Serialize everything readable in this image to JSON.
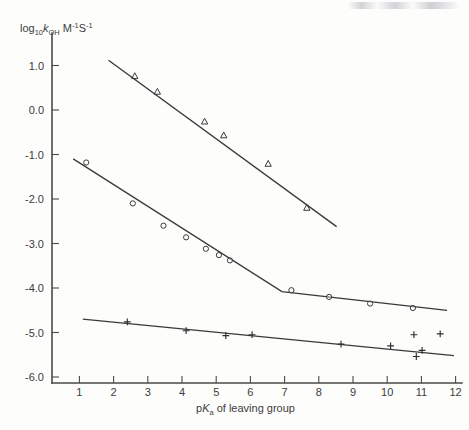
{
  "chart_data": {
    "type": "scatter",
    "title": "",
    "xlabel": "pKa of leaving group",
    "ylabel": "log10 kOH M-1 s-1",
    "xlim": [
      0,
      12.4
    ],
    "ylim": [
      -6.5,
      1.45
    ],
    "xticks": [
      1,
      2,
      3,
      4,
      5,
      6,
      7,
      8,
      9,
      10,
      11,
      12
    ],
    "yticks": [
      "1.0",
      "0.0",
      "-1.0",
      "-2.0",
      "-3.0",
      "-4.0",
      "-5.0",
      "-6.0"
    ],
    "ytick_values": [
      1.0,
      0.0,
      -1.0,
      -2.0,
      -3.0,
      -4.0,
      -5.0,
      -6.0
    ],
    "grid": false,
    "legend": "none",
    "series": [
      {
        "name": "upper series (triangles)",
        "marker": "triangle",
        "points": [
          {
            "x": 2.62,
            "y": 0.76
          },
          {
            "x": 3.28,
            "y": 0.41
          },
          {
            "x": 4.66,
            "y": -0.26
          },
          {
            "x": 5.22,
            "y": -0.57
          },
          {
            "x": 6.52,
            "y": -1.21
          },
          {
            "x": 7.65,
            "y": -2.2
          }
        ],
        "fit_line": [
          {
            "x": 1.85,
            "y": 1.12
          },
          {
            "x": 8.52,
            "y": -2.62
          }
        ]
      },
      {
        "name": "middle series (circles)",
        "marker": "circle",
        "points": [
          {
            "x": 1.2,
            "y": -1.18
          },
          {
            "x": 2.56,
            "y": -2.1
          },
          {
            "x": 3.46,
            "y": -2.6
          },
          {
            "x": 4.12,
            "y": -2.86
          },
          {
            "x": 4.7,
            "y": -3.12
          },
          {
            "x": 5.08,
            "y": -3.26
          },
          {
            "x": 5.4,
            "y": -3.38
          },
          {
            "x": 7.2,
            "y": -4.05
          },
          {
            "x": 8.3,
            "y": -4.2
          },
          {
            "x": 9.5,
            "y": -4.35
          },
          {
            "x": 10.75,
            "y": -4.45
          }
        ],
        "fit_line": [
          {
            "x": 0.82,
            "y": -1.1
          },
          {
            "x": 6.92,
            "y": -4.08
          },
          {
            "x": 11.75,
            "y": -4.5
          }
        ]
      },
      {
        "name": "lower series (plus)",
        "marker": "plus",
        "points": [
          {
            "x": 2.4,
            "y": -4.76
          },
          {
            "x": 4.12,
            "y": -4.96
          },
          {
            "x": 5.28,
            "y": -5.07
          },
          {
            "x": 6.05,
            "y": -5.05
          },
          {
            "x": 8.65,
            "y": -5.26
          },
          {
            "x": 10.1,
            "y": -5.3
          },
          {
            "x": 10.78,
            "y": -5.05
          },
          {
            "x": 10.85,
            "y": -5.54
          },
          {
            "x": 11.02,
            "y": -5.4
          },
          {
            "x": 11.55,
            "y": -5.03
          }
        ],
        "fit_line": [
          {
            "x": 1.1,
            "y": -4.7
          },
          {
            "x": 11.95,
            "y": -5.52
          }
        ]
      }
    ]
  },
  "labels": {
    "y_axis_title_parts": {
      "main": "log",
      "sub10": "10",
      "k": "k",
      "oh": "OH",
      "m": "M",
      "m_exp": "-1",
      "s": "S",
      "s_exp": "-1"
    },
    "x_axis_title_parts": {
      "pk": "pK",
      "a": "a",
      "rest": " of leaving group"
    }
  }
}
